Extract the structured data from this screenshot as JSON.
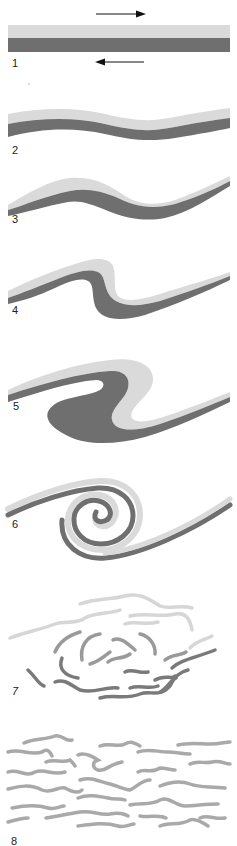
{
  "figure": {
    "colors": {
      "upper_layer": "#dadada",
      "lower_layer": "#6f6f6f",
      "turbulent_mid": "#9a9a9a",
      "turbulent_light": "#d6d6d6",
      "mixed": "#a9a9a9",
      "arrow": "#111111",
      "label": "#222222"
    },
    "arrows": {
      "top": {
        "direction": "right"
      },
      "bottom": {
        "direction": "left"
      }
    },
    "panels": [
      {
        "label": "1",
        "stage": "flat shear layer"
      },
      {
        "label": "2",
        "stage": "small wave perturbation"
      },
      {
        "label": "3",
        "stage": "wave amplifying"
      },
      {
        "label": "4",
        "stage": "wave steepening"
      },
      {
        "label": "5",
        "stage": "billow overturning"
      },
      {
        "label": "6",
        "stage": "rolled-up vortex"
      },
      {
        "label": "7",
        "stage": "breakdown into turbulence"
      },
      {
        "label": "8",
        "stage": "mixed layer"
      }
    ]
  }
}
